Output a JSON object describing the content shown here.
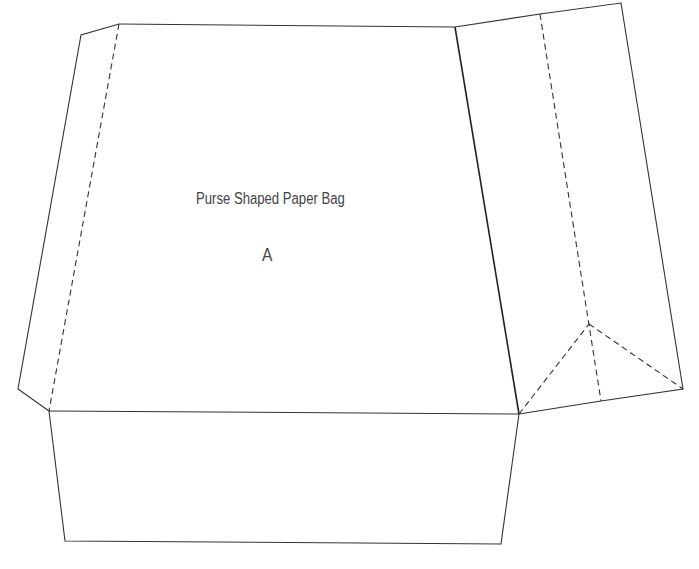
{
  "template": {
    "title": "Purse Shaped Paper Bag",
    "piece_label": "A"
  },
  "colors": {
    "line": "#333333",
    "text": "#444444",
    "background": "#ffffff"
  }
}
